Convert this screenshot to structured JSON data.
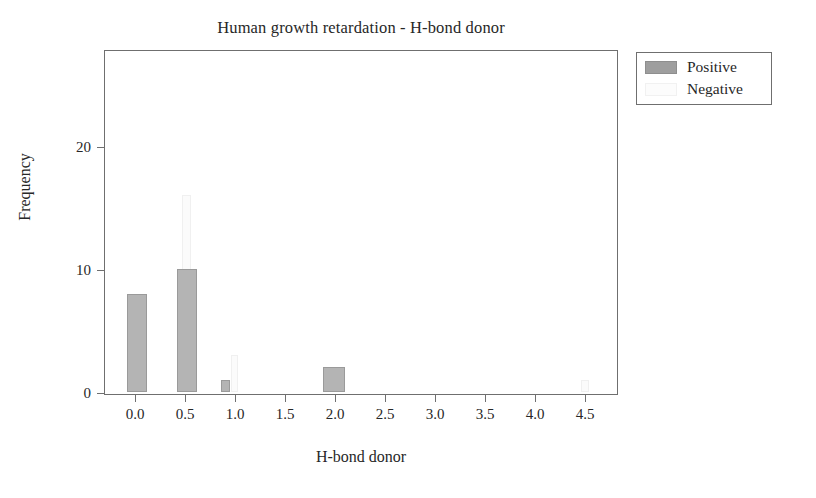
{
  "chart_data": {
    "type": "bar",
    "title": "Human growth retardation - H-bond donor",
    "xlabel": "H-bond donor",
    "ylabel": "Frequency",
    "xticklabels": [
      "0.0",
      "0.5",
      "1.0",
      "1.5",
      "2.0",
      "2.5",
      "3.0",
      "3.5",
      "4.0",
      "4.5"
    ],
    "xtickvalues": [
      0.0,
      0.5,
      1.0,
      1.5,
      2.0,
      2.5,
      3.0,
      3.5,
      4.0,
      4.5
    ],
    "yticklabels": [
      "0",
      "10",
      "20"
    ],
    "ytickvalues": [
      0,
      10,
      20
    ],
    "xlim": [
      -0.25,
      4.85
    ],
    "ylim": [
      0,
      27
    ],
    "grid": false,
    "legend_position": "outside right top",
    "series": [
      {
        "name": "Positive",
        "color": "#b4b4b4",
        "x": [
          0.0,
          0.5,
          1.0,
          2.0
        ],
        "values": [
          8,
          10,
          1,
          2
        ]
      },
      {
        "name": "Negative",
        "color": "#fbfbfb",
        "x": [
          0.5,
          1.0,
          4.5
        ],
        "values": [
          16,
          3,
          1
        ]
      }
    ],
    "bars": [
      {
        "series": "Positive",
        "x": 0.0,
        "value": 8,
        "left_px": 126,
        "width_px": 20
      },
      {
        "series": "Positive",
        "x": 0.5,
        "value": 10,
        "left_px": 176,
        "width_px": 20
      },
      {
        "series": "Negative",
        "x": 0.52,
        "value": 16,
        "left_px": 181,
        "width_px": 9
      },
      {
        "series": "Positive",
        "x": 1.0,
        "value": 1,
        "left_px": 220,
        "width_px": 9
      },
      {
        "series": "Negative",
        "x": 1.05,
        "value": 3,
        "left_px": 230,
        "width_px": 7
      },
      {
        "series": "Positive",
        "x": 2.0,
        "value": 2,
        "left_px": 322,
        "width_px": 22
      },
      {
        "series": "Negative",
        "x": 4.5,
        "value": 1,
        "left_px": 580,
        "width_px": 8
      }
    ]
  },
  "legend": {
    "entries": [
      {
        "label": "Positive"
      },
      {
        "label": "Negative"
      }
    ]
  },
  "colors": {
    "positive": "#b4b4b4",
    "negative": "#fbfbfb",
    "axis": "#6f6f6f",
    "text": "#272727",
    "background": "#ffffff"
  }
}
